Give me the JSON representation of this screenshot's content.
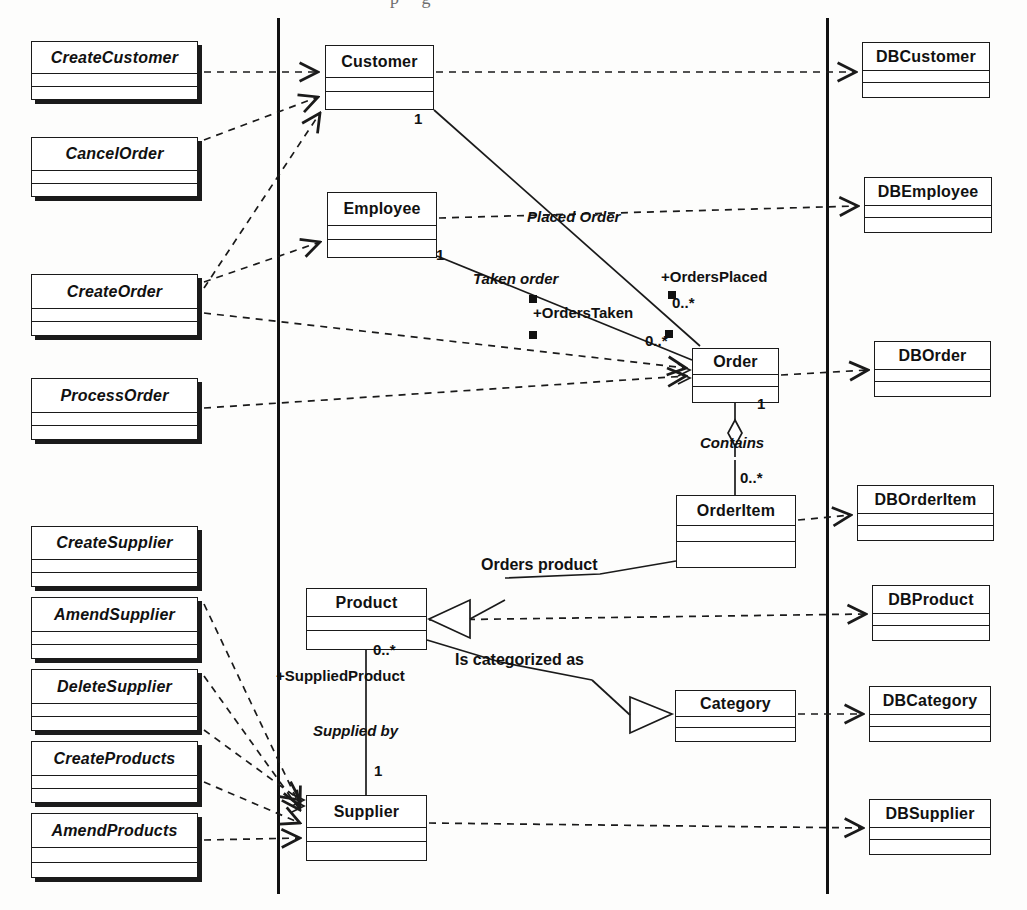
{
  "diagram": {
    "type": "uml-class-diagram",
    "partitions": 3,
    "colors": {
      "line": "#1a1a1a",
      "fill": "#ffffff",
      "shadow": "#1b1b1b"
    }
  },
  "boundary_classes": [
    {
      "name": "CreateCustomer",
      "x": 31,
      "y": 41,
      "w": 167,
      "h": 59
    },
    {
      "name": "CancelOrder",
      "x": 31,
      "y": 137,
      "w": 167,
      "h": 60
    },
    {
      "name": "CreateOrder",
      "x": 31,
      "y": 274,
      "w": 167,
      "h": 62
    },
    {
      "name": "ProcessOrder",
      "x": 31,
      "y": 378,
      "w": 167,
      "h": 62
    },
    {
      "name": "CreateSupplier",
      "x": 31,
      "y": 526,
      "w": 167,
      "h": 61
    },
    {
      "name": "AmendSupplier",
      "x": 31,
      "y": 597,
      "w": 167,
      "h": 62
    },
    {
      "name": "DeleteSupplier",
      "x": 31,
      "y": 669,
      "w": 167,
      "h": 62
    },
    {
      "name": "CreateProducts",
      "x": 31,
      "y": 741,
      "w": 167,
      "h": 62
    },
    {
      "name": "AmendProducts",
      "x": 31,
      "y": 813,
      "w": 167,
      "h": 65
    }
  ],
  "entity_classes": [
    {
      "name": "Customer",
      "x": 325,
      "y": 45,
      "w": 109,
      "h": 65
    },
    {
      "name": "Employee",
      "x": 327,
      "y": 192,
      "w": 110,
      "h": 66
    },
    {
      "name": "Order",
      "x": 692,
      "y": 348,
      "w": 87,
      "h": 55
    },
    {
      "name": "OrderItem",
      "x": 676,
      "y": 495,
      "w": 120,
      "h": 73
    },
    {
      "name": "Product",
      "x": 306,
      "y": 588,
      "w": 121,
      "h": 62
    },
    {
      "name": "Category",
      "x": 675,
      "y": 690,
      "w": 121,
      "h": 52
    },
    {
      "name": "Supplier",
      "x": 306,
      "y": 795,
      "w": 121,
      "h": 66
    }
  ],
  "db_classes": [
    {
      "name": "DBCustomer",
      "x": 862,
      "y": 42,
      "w": 128,
      "h": 56
    },
    {
      "name": "DBEmployee",
      "x": 864,
      "y": 177,
      "w": 128,
      "h": 56
    },
    {
      "name": "DBOrder",
      "x": 874,
      "y": 341,
      "w": 117,
      "h": 56
    },
    {
      "name": "DBOrderItem",
      "x": 857,
      "y": 485,
      "w": 137,
      "h": 56
    },
    {
      "name": "DBProduct",
      "x": 872,
      "y": 585,
      "w": 118,
      "h": 56
    },
    {
      "name": "DBCategory",
      "x": 869,
      "y": 686,
      "w": 122,
      "h": 56
    },
    {
      "name": "DBSupplier",
      "x": 869,
      "y": 799,
      "w": 122,
      "h": 56
    }
  ],
  "association_labels": [
    {
      "text": "Placed Order",
      "x": 527,
      "y": 217,
      "italic": true,
      "size": 15
    },
    {
      "text": "Taken order",
      "x": 473,
      "y": 279,
      "italic": true,
      "size": 15
    },
    {
      "text": "+OrdersPlaced",
      "x": 661,
      "y": 277,
      "italic": false,
      "size": 15
    },
    {
      "text": "+OrdersTaken",
      "x": 533,
      "y": 313,
      "italic": false,
      "size": 15
    },
    {
      "text": "Contains",
      "x": 700,
      "y": 443,
      "italic": true,
      "size": 15
    },
    {
      "text": "Orders product",
      "x": 481,
      "y": 566,
      "italic": false,
      "size": 16
    },
    {
      "text": "Is categorized as",
      "x": 455,
      "y": 661,
      "italic": false,
      "size": 16
    },
    {
      "text": "+SuppliedProduct",
      "x": 276,
      "y": 676,
      "italic": false,
      "size": 15
    },
    {
      "text": "Supplied by",
      "x": 313,
      "y": 731,
      "italic": true,
      "size": 15
    }
  ],
  "multiplicities": [
    {
      "text": "1",
      "x": 414,
      "y": 119
    },
    {
      "text": "1",
      "x": 436,
      "y": 255
    },
    {
      "text": "0..*",
      "x": 672,
      "y": 303
    },
    {
      "text": "0..*",
      "x": 645,
      "y": 341
    },
    {
      "text": "1",
      "x": 757,
      "y": 404
    },
    {
      "text": "0..*",
      "x": 740,
      "y": 478
    },
    {
      "text": "0..*",
      "x": 373,
      "y": 650
    },
    {
      "text": "1",
      "x": 374,
      "y": 771
    }
  ],
  "role_markers": [
    {
      "x": 529,
      "y": 295
    },
    {
      "x": 668,
      "y": 291
    },
    {
      "x": 529,
      "y": 331
    },
    {
      "x": 665,
      "y": 330
    }
  ]
}
